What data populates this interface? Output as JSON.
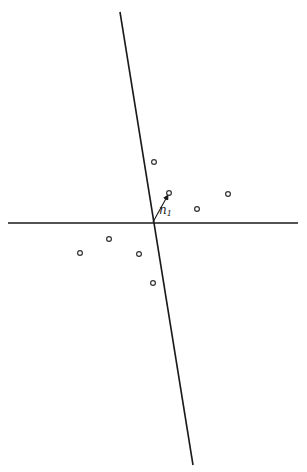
{
  "figure": {
    "colors": {
      "line": "#1a1a1a",
      "point_stroke": "#333333",
      "background": "#ffffff"
    },
    "horizontal_axis": {
      "x1": 8,
      "y1": 223,
      "x2": 298,
      "y2": 223
    },
    "tilted_line": {
      "x1": 120,
      "y1": 12,
      "x2": 193,
      "y2": 465
    },
    "origin": {
      "x": 153,
      "y": 222
    },
    "vector": {
      "label": "n",
      "subscript": "1",
      "x1": 153,
      "y1": 222,
      "x2": 168,
      "y2": 195
    },
    "points": [
      {
        "x": 154,
        "y": 162
      },
      {
        "x": 169,
        "y": 193
      },
      {
        "x": 197,
        "y": 209
      },
      {
        "x": 228,
        "y": 194
      },
      {
        "x": 80,
        "y": 253
      },
      {
        "x": 109,
        "y": 239
      },
      {
        "x": 139,
        "y": 254
      },
      {
        "x": 153,
        "y": 283
      }
    ]
  }
}
